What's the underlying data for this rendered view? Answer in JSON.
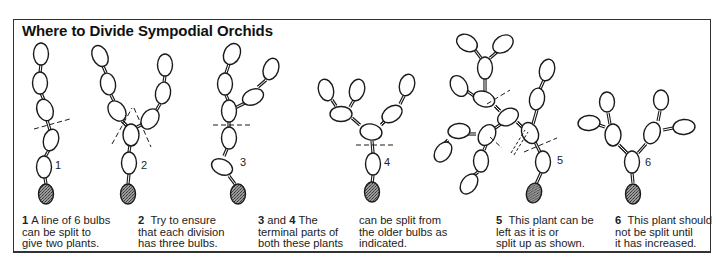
{
  "title": "Where to Divide Sympodial Orchids",
  "figure_labels": [
    "1",
    "2",
    "3",
    "4",
    "5",
    "6"
  ],
  "captions": [
    {
      "num": "1",
      "lines": [
        "A line of 6 bulbs",
        "can be split to",
        "give two plants."
      ]
    },
    {
      "num": "2",
      "lines": [
        "Try to ensure",
        "that each division",
        "has three bulbs."
      ]
    },
    {
      "num": "3",
      "joiner": "and",
      "num2": "4",
      "lines": [
        "The",
        "terminal parts of",
        "both these plants"
      ]
    },
    {
      "num": "",
      "lines": [
        "can be split from",
        "the older bulbs as",
        "indicated."
      ]
    },
    {
      "num": "5",
      "lines": [
        "This plant can be",
        "left as it is or",
        "split up as shown."
      ]
    },
    {
      "num": "6",
      "lines": [
        "This plant should",
        "not be split until",
        "it has increased."
      ]
    }
  ],
  "colors": {
    "line": "#1a1a1a",
    "old_bulb_fill": "#8a8a8a",
    "frame": "#333333"
  }
}
